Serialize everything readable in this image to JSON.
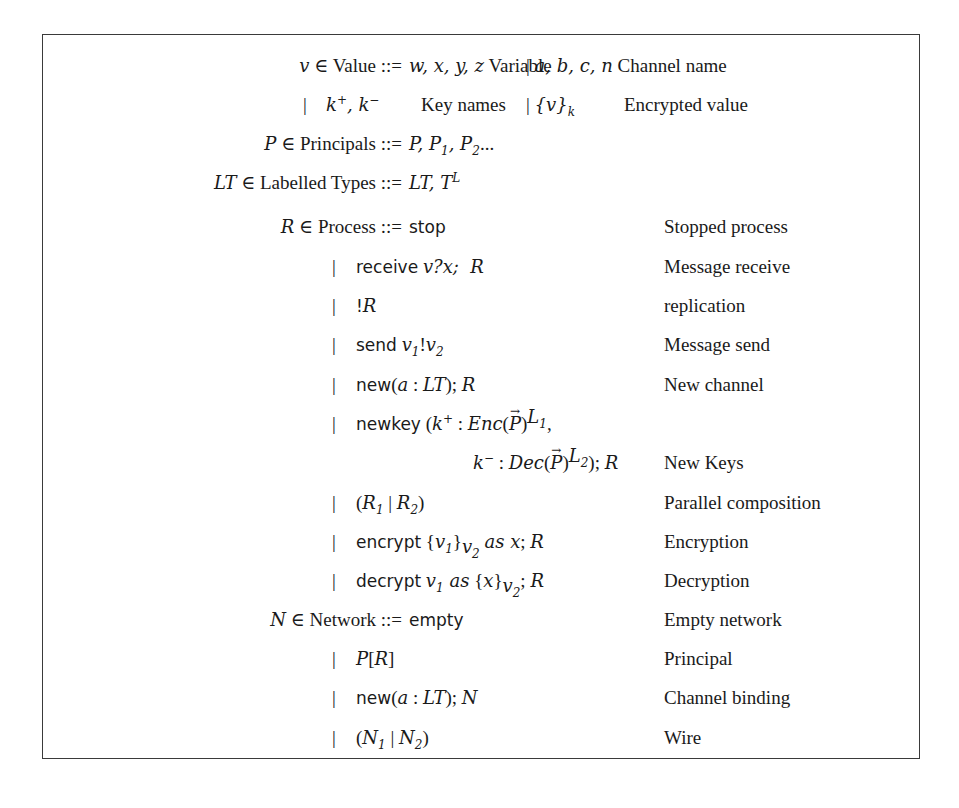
{
  "figure": {
    "value": {
      "lhs": "v ∈ Value ::=",
      "alts_row1": {
        "a": "w, x, y, z",
        "a_desc": "Variable",
        "b": "a, b, c, n",
        "b_desc": "Channel name"
      },
      "alts_row2": {
        "a": "k⁺, k⁻",
        "a_desc": "Key names",
        "b": "{v}_k",
        "b_desc": "Encrypted value"
      }
    },
    "principals": {
      "lhs": "P ∈ Principals ::=",
      "rhs": "P, P1, P2..."
    },
    "labelled_types": {
      "lhs": "LT ∈ Labelled Types ::=",
      "rhs": "LT, T^L"
    },
    "process": {
      "lhs": "R ∈ Process ::=",
      "alts": [
        {
          "term": "stop",
          "desc": "Stopped process"
        },
        {
          "term": "receive v?x; R",
          "desc": "Message receive"
        },
        {
          "term": "!R",
          "desc": "replication"
        },
        {
          "term": "send v1!v2",
          "desc": "Message send"
        },
        {
          "term": "new(a : LT); R",
          "desc": "New channel"
        },
        {
          "term": "newkey (k⁺ : Enc(P⃗)^L1, k⁻ : Dec(P⃗)^L2); R",
          "desc": "New Keys"
        },
        {
          "term": "(R1 | R2)",
          "desc": "Parallel composition"
        },
        {
          "term": "encrypt {v1}_v2 as x; R",
          "desc": "Encryption"
        },
        {
          "term": "decrypt v1 as {x}_v2; R",
          "desc": "Decryption"
        }
      ]
    },
    "network": {
      "lhs": "N ∈ Network ::=",
      "alts": [
        {
          "term": "empty",
          "desc": "Empty network"
        },
        {
          "term": "P[R]",
          "desc": "Principal"
        },
        {
          "term": "new(a : LT); N",
          "desc": "Channel binding"
        },
        {
          "term": "(N1 | N2)",
          "desc": "Wire"
        }
      ]
    }
  },
  "text": {
    "in": "∈",
    "defeq": "::=",
    "bar": "|",
    "Value": "Value",
    "Principals": "Principals",
    "LabelledTypes": "Labelled Types",
    "Process": "Process",
    "Network": "Network",
    "kw_stop": "stop",
    "kw_receive": "receive",
    "kw_send": "send",
    "kw_new": "new",
    "kw_newkey": "newkey",
    "kw_encrypt": "encrypt",
    "kw_decrypt": "decrypt",
    "kw_empty": "empty"
  }
}
